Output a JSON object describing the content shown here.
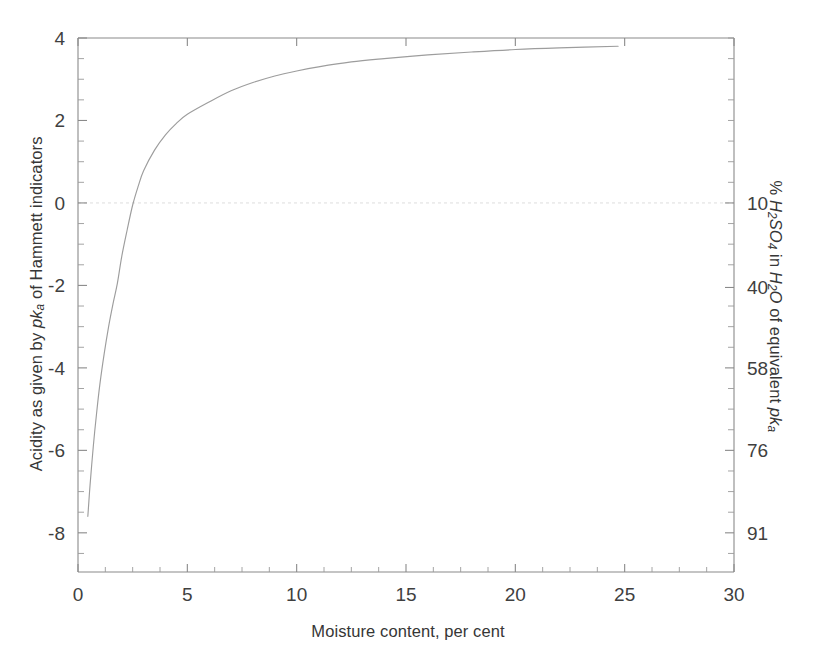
{
  "chart_data": {
    "type": "line",
    "title": "",
    "xlabel": "Moisture content, per cent",
    "ylabel": "Acidity as given by pka of Hammett indicators",
    "ylabel_right": "% H2SO4 in H2O of equivalent pka",
    "xlim": [
      0,
      30
    ],
    "ylim": [
      -8.95,
      4
    ],
    "grid": false,
    "legend": null,
    "x_ticks": [
      0,
      5,
      10,
      15,
      20,
      25,
      30
    ],
    "x_tick_labels": [
      "0",
      "5",
      "10",
      "15",
      "20",
      "25",
      "30"
    ],
    "x_minor_tick_step": 1.25,
    "y_ticks": [
      4,
      2,
      0,
      -2,
      -4,
      -6,
      -8
    ],
    "y_tick_labels": [
      "4",
      "2",
      "0",
      "-2",
      "-4",
      "-6",
      "-8"
    ],
    "y_minor_tick_step": 0.5,
    "y_right_ticks": [
      0,
      -2.05,
      -4.0,
      -6.0,
      -8.0
    ],
    "y_right_tick_labels": [
      "10",
      "40",
      "58",
      "76",
      "91"
    ],
    "zero_gridline": true,
    "series": [
      {
        "name": "Acidity vs moisture",
        "x": [
          0.45,
          0.55,
          0.7,
          0.85,
          1.0,
          1.2,
          1.4,
          1.6,
          1.8,
          2.0,
          2.25,
          2.5,
          2.75,
          3.0,
          3.5,
          4.0,
          4.5,
          5.0,
          6.0,
          7.0,
          8.0,
          9.0,
          10.0,
          11.0,
          12.5,
          14.0,
          16.0,
          18.0,
          20.0,
          22.0,
          24.7
        ],
        "y": [
          -7.6,
          -6.85,
          -5.9,
          -5.1,
          -4.4,
          -3.65,
          -3.0,
          -2.45,
          -1.95,
          -1.3,
          -0.65,
          -0.05,
          0.4,
          0.78,
          1.28,
          1.65,
          1.93,
          2.15,
          2.45,
          2.72,
          2.92,
          3.08,
          3.2,
          3.3,
          3.42,
          3.5,
          3.59,
          3.66,
          3.72,
          3.76,
          3.8
        ]
      }
    ]
  },
  "axis_titles": {
    "left_part1": "Acidity as given by ",
    "left_italic1": "pk",
    "left_sub1": "a",
    "left_part2": " of Hammett indicators",
    "right_part1": "% ",
    "right_italic_h": "H",
    "right_sub_2a": "2",
    "right_italic_so": "SO",
    "right_sub_4": "4",
    "right_part2": " in ",
    "right_italic_h2": "H",
    "right_sub_2b": "2",
    "right_italic_o": "O",
    "right_part3": " of equivalent ",
    "right_italic_pk": "pk",
    "right_sub_a": "a",
    "bottom": "Moisture content, per cent"
  }
}
